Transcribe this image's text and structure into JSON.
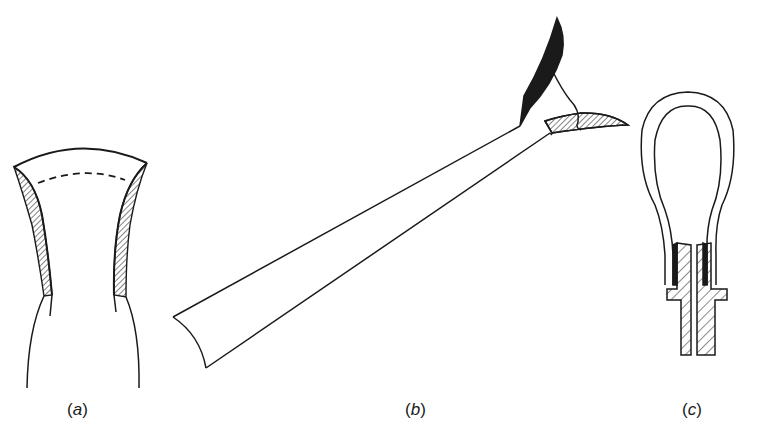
{
  "figure": {
    "panels": [
      {
        "id": "a",
        "label": "(a)",
        "label_letter": "a",
        "description": "flared tube end with hatched wall section"
      },
      {
        "id": "b",
        "label": "(b)",
        "label_letter": "b",
        "description": "long tube with split curved tip, one blade solid black, one hatched"
      },
      {
        "id": "c",
        "label": "(c)",
        "label_letter": "c",
        "description": "loop tube inserted into hatched split socket"
      }
    ]
  },
  "colors": {
    "ink": "#1a1a1a",
    "background": "#ffffff"
  }
}
